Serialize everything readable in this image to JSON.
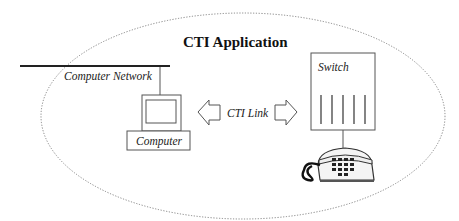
{
  "diagram": {
    "title": "CTI Application",
    "labels": {
      "network": "Computer Network",
      "computer": "Computer",
      "link": "CTI Link",
      "switch": "Switch"
    },
    "colors": {
      "stroke": "#555555",
      "network_line": "#222222",
      "ellipse": "#777777"
    },
    "nodes": [
      {
        "id": "computer-network",
        "label": "Computer Network",
        "type": "bus"
      },
      {
        "id": "computer",
        "label": "Computer",
        "type": "pc"
      },
      {
        "id": "switch",
        "label": "Switch",
        "type": "pbx"
      },
      {
        "id": "telephone",
        "label": "",
        "type": "phone"
      }
    ],
    "edges": [
      {
        "from": "computer-network",
        "to": "computer"
      },
      {
        "from": "computer",
        "to": "switch",
        "label": "CTI Link",
        "bidirectional": true
      },
      {
        "from": "switch",
        "to": "telephone"
      }
    ]
  }
}
